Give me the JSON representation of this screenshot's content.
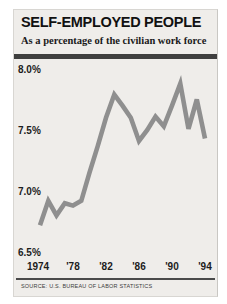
{
  "title": "SELF-EMPLOYED PEOPLE",
  "subtitle": "As a percentage of the civilian work force",
  "source": "SOURCE: U.S. BUREAU OF LABOR STATISTICS",
  "colors": {
    "card_background": "#efedea",
    "divider_bar": "#3f3f3f",
    "line": "#8f8f8f",
    "text": "#1a1a1a"
  },
  "chart_data": {
    "type": "line",
    "title": "SELF-EMPLOYED PEOPLE",
    "subtitle": "As a percentage of the civilian work force",
    "x": [
      1974,
      1975,
      1976,
      1977,
      1978,
      1979,
      1980,
      1981,
      1982,
      1983,
      1984,
      1985,
      1986,
      1987,
      1988,
      1989,
      1990,
      1991,
      1992,
      1993,
      1994
    ],
    "series": [
      {
        "name": "Self-employed as percentage of civilian work force",
        "values": [
          6.72,
          6.92,
          6.8,
          6.9,
          6.88,
          6.92,
          7.15,
          7.37,
          7.6,
          7.79,
          7.7,
          7.6,
          7.41,
          7.5,
          7.61,
          7.53,
          7.7,
          7.88,
          7.51,
          7.75,
          7.43
        ]
      }
    ],
    "y_ticks": [
      "8.0%",
      "7.5%",
      "7.0%",
      "6.5%"
    ],
    "x_ticks": [
      "1974",
      "'78",
      "'82",
      "'86",
      "'90",
      "'94"
    ],
    "ylim": [
      6.5,
      8.0
    ],
    "xlim": [
      1974,
      1994
    ],
    "grid": false,
    "legend": "none",
    "line_color": "#8f8f8f",
    "source": "SOURCE: U.S. BUREAU OF LABOR STATISTICS"
  }
}
